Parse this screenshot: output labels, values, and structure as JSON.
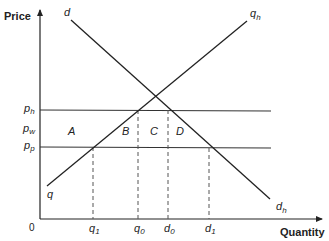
{
  "diagram": {
    "type": "supply-demand-price-band",
    "axes": {
      "y_label": "Price",
      "x_label": "Quantity",
      "origin_label": "0"
    },
    "curves": {
      "demand": {
        "start_label": "d",
        "end_label": "d",
        "end_sub": "h"
      },
      "supply": {
        "start_label": "q",
        "end_label": "q",
        "end_sub": "h"
      }
    },
    "price_levels": [
      {
        "id": "ph",
        "label": "p",
        "sub": "h",
        "line": true
      },
      {
        "id": "pw",
        "label": "p",
        "sub": "w",
        "line": false
      },
      {
        "id": "pp",
        "label": "p",
        "sub": "p",
        "line": true
      }
    ],
    "quantity_ticks": [
      {
        "id": "q1",
        "label": "q",
        "sub": "1"
      },
      {
        "id": "q0",
        "label": "q",
        "sub": "0"
      },
      {
        "id": "d0",
        "label": "d",
        "sub": "0"
      },
      {
        "id": "d1",
        "label": "d",
        "sub": "1"
      }
    ],
    "areas": [
      "A",
      "B",
      "C",
      "D"
    ],
    "colors": {
      "line": "#222222",
      "dashed": "#555555",
      "background": "#ffffff"
    }
  }
}
